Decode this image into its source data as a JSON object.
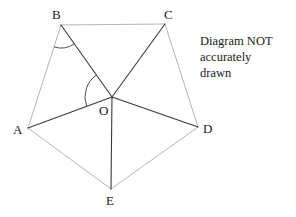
{
  "figure": {
    "title_note": "Diagram NOT\naccurately\ndrawn",
    "note_lines": [
      "Diagram NOT",
      "accurately",
      "drawn"
    ],
    "background_color": "#ffffff",
    "outer_edge_color": "#b5b5b5",
    "spoke_color": "#3a3a3a",
    "arc_color": "#3a3a3a",
    "label_color": "#1a1a1a",
    "vertices": [
      {
        "id": "A",
        "label": "A",
        "x": 28,
        "y": 128,
        "label_x": 13,
        "label_y": 123
      },
      {
        "id": "B",
        "label": "B",
        "x": 61,
        "y": 25,
        "label_x": 52,
        "label_y": 8
      },
      {
        "id": "C",
        "label": "C",
        "x": 165,
        "y": 24,
        "label_x": 164,
        "label_y": 8
      },
      {
        "id": "D",
        "label": "D",
        "x": 198,
        "y": 127,
        "label_x": 203,
        "label_y": 122
      },
      {
        "id": "E",
        "label": "E",
        "x": 111,
        "y": 189,
        "label_x": 106,
        "label_y": 194
      },
      {
        "id": "O",
        "label": "O",
        "x": 112,
        "y": 97,
        "label_x": 99,
        "label_y": 104
      }
    ],
    "outer_edges": [
      {
        "from": "A",
        "to": "B"
      },
      {
        "from": "B",
        "to": "C"
      },
      {
        "from": "C",
        "to": "D"
      },
      {
        "from": "D",
        "to": "E"
      },
      {
        "from": "E",
        "to": "A"
      }
    ],
    "spokes": [
      {
        "from": "O",
        "to": "A"
      },
      {
        "from": "O",
        "to": "B"
      },
      {
        "from": "O",
        "to": "C"
      },
      {
        "from": "O",
        "to": "D"
      },
      {
        "from": "O",
        "to": "E"
      }
    ],
    "angle_arcs": [
      {
        "at": "B",
        "from": "A",
        "to": "O",
        "radius": 23
      },
      {
        "at": "O",
        "from": "A",
        "to": "B",
        "radius": 27
      }
    ]
  }
}
